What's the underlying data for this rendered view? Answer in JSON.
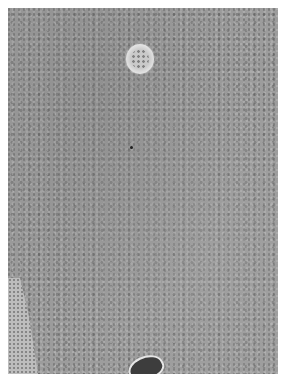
{
  "image": {
    "kind": "grayscale histology micrograph",
    "background_color": "#ffffff",
    "tissue_tone": "#9c9c9c",
    "features": [
      {
        "name": "pale-round-structure",
        "approx_center": [
          132,
          51
        ],
        "tone": "#e0e0e0"
      },
      {
        "name": "dark-vessel",
        "approx_center": [
          136,
          358
        ],
        "tone": "#3d3d3d"
      },
      {
        "name": "loose-tissue-edge",
        "location": "lower-left",
        "tone": "#bdbdbd"
      },
      {
        "name": "dark-dot",
        "approx_center": [
          123,
          139
        ],
        "tone": "#1f1f1f"
      }
    ]
  }
}
